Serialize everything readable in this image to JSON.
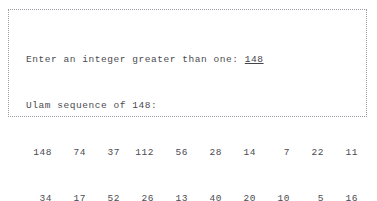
{
  "window": {
    "kind": "console-output-box",
    "border_color": "#9a9aa4",
    "background_color": "#ffffff",
    "text_color": "#4b4b52"
  },
  "console": {
    "prompt": {
      "label": "Enter an integer greater than one: ",
      "user_input": "148"
    },
    "header": "Ulam sequence of 148:",
    "footer": "Length was 24",
    "sequence_rows": [
      [
        "148",
        "74",
        "37",
        "112",
        "56",
        "28",
        "14",
        "7",
        "22",
        "11"
      ],
      [
        "34",
        "17",
        "52",
        "26",
        "13",
        "40",
        "20",
        "10",
        "5",
        "16"
      ],
      [
        "8",
        "4",
        "2",
        "1"
      ]
    ]
  },
  "chart_data": {
    "type": "table",
    "title": "Ulam sequence of 148",
    "values": [
      148,
      74,
      37,
      112,
      56,
      28,
      14,
      7,
      22,
      11,
      34,
      17,
      52,
      26,
      13,
      40,
      20,
      10,
      5,
      16,
      8,
      4,
      2,
      1
    ],
    "length": 24,
    "seed": 148
  }
}
